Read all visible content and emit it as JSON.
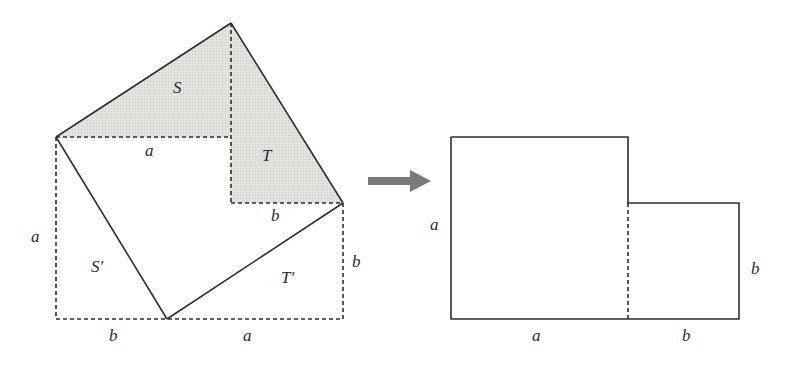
{
  "figure": {
    "colors": {
      "stroke": "#2e2e2e",
      "shade": "#dcdcd8",
      "arrow": "#7a7a7a",
      "background": "#ffffff"
    },
    "left_figure": {
      "regions": {
        "S": "S",
        "T": "T",
        "S_prime": "S′",
        "T_prime": "T′"
      },
      "labels": {
        "inner_a": "a",
        "inner_b": "b",
        "left_a": "a",
        "right_b": "b",
        "bottom_b": "b",
        "bottom_a": "a"
      }
    },
    "arrow": {
      "direction": "right"
    },
    "right_figure": {
      "labels": {
        "left_a": "a",
        "right_b": "b",
        "bottom_a": "a",
        "bottom_b": "b"
      }
    }
  }
}
